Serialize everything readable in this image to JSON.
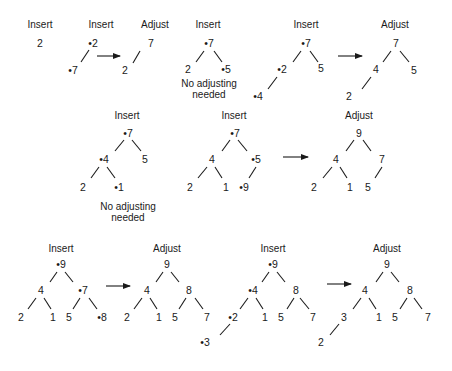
{
  "diagram": {
    "colors": {
      "ink": "#1a1a1a",
      "background": "#ffffff"
    },
    "labels": [
      {
        "text": "Insert",
        "x": 40,
        "y": 28
      },
      {
        "text": "Insert",
        "x": 101,
        "y": 28
      },
      {
        "text": "Adjust",
        "x": 155,
        "y": 28
      },
      {
        "text": "Insert",
        "x": 208,
        "y": 28
      },
      {
        "text": "Insert",
        "x": 306,
        "y": 28
      },
      {
        "text": "Adjust",
        "x": 395,
        "y": 28
      },
      {
        "text": "Insert",
        "x": 127,
        "y": 119
      },
      {
        "text": "Insert",
        "x": 234,
        "y": 119
      },
      {
        "text": "Adjust",
        "x": 359,
        "y": 119
      },
      {
        "text": "Insert",
        "x": 61,
        "y": 252
      },
      {
        "text": "Adjust",
        "x": 167,
        "y": 252
      },
      {
        "text": "Insert",
        "x": 273,
        "y": 252
      },
      {
        "text": "Adjust",
        "x": 387,
        "y": 252
      }
    ],
    "nodes": [
      {
        "text": "2",
        "x": 40,
        "y": 47
      },
      {
        "text": "•2",
        "x": 93,
        "y": 47
      },
      {
        "text": "•7",
        "x": 73,
        "y": 74
      },
      {
        "text": "7",
        "x": 151,
        "y": 47
      },
      {
        "text": "2",
        "x": 125,
        "y": 74
      },
      {
        "text": "•7",
        "x": 209,
        "y": 47
      },
      {
        "text": "2",
        "x": 188,
        "y": 73
      },
      {
        "text": "•5",
        "x": 226,
        "y": 73
      },
      {
        "text": "•7",
        "x": 306,
        "y": 47
      },
      {
        "text": "•2",
        "x": 282,
        "y": 73
      },
      {
        "text": "5",
        "x": 321,
        "y": 72
      },
      {
        "text": "•4",
        "x": 258,
        "y": 100
      },
      {
        "text": "7",
        "x": 396,
        "y": 47
      },
      {
        "text": "4",
        "x": 376,
        "y": 73
      },
      {
        "text": "5",
        "x": 414,
        "y": 74
      },
      {
        "text": "2",
        "x": 349,
        "y": 100
      },
      {
        "text": "•7",
        "x": 128,
        "y": 137
      },
      {
        "text": "•4",
        "x": 104,
        "y": 163
      },
      {
        "text": "5",
        "x": 145,
        "y": 163
      },
      {
        "text": "2",
        "x": 83,
        "y": 191
      },
      {
        "text": "•1",
        "x": 119,
        "y": 191
      },
      {
        "text": "•7",
        "x": 235,
        "y": 137
      },
      {
        "text": "4",
        "x": 212,
        "y": 163
      },
      {
        "text": "•5",
        "x": 256,
        "y": 163
      },
      {
        "text": "2",
        "x": 190,
        "y": 191
      },
      {
        "text": "1",
        "x": 226,
        "y": 191
      },
      {
        "text": "•9",
        "x": 244,
        "y": 191
      },
      {
        "text": "9",
        "x": 359,
        "y": 137
      },
      {
        "text": "4",
        "x": 336,
        "y": 163
      },
      {
        "text": "7",
        "x": 382,
        "y": 163
      },
      {
        "text": "2",
        "x": 314,
        "y": 191
      },
      {
        "text": "1",
        "x": 350,
        "y": 191
      },
      {
        "text": "5",
        "x": 368,
        "y": 191
      },
      {
        "text": "•9",
        "x": 61,
        "y": 268
      },
      {
        "text": "4",
        "x": 41,
        "y": 294
      },
      {
        "text": "•7",
        "x": 83,
        "y": 294
      },
      {
        "text": "2",
        "x": 21,
        "y": 321
      },
      {
        "text": "1",
        "x": 53,
        "y": 321
      },
      {
        "text": "5",
        "x": 69,
        "y": 321
      },
      {
        "text": "•8",
        "x": 102,
        "y": 321
      },
      {
        "text": "9",
        "x": 167,
        "y": 268
      },
      {
        "text": "4",
        "x": 147,
        "y": 294
      },
      {
        "text": "8",
        "x": 189,
        "y": 294
      },
      {
        "text": "2",
        "x": 127,
        "y": 321
      },
      {
        "text": "1",
        "x": 159,
        "y": 321
      },
      {
        "text": "5",
        "x": 175,
        "y": 321
      },
      {
        "text": "7",
        "x": 207,
        "y": 321
      },
      {
        "text": "•9",
        "x": 273,
        "y": 268
      },
      {
        "text": "•4",
        "x": 253,
        "y": 294
      },
      {
        "text": "8",
        "x": 296,
        "y": 294
      },
      {
        "text": "•2",
        "x": 233,
        "y": 321
      },
      {
        "text": "1",
        "x": 265,
        "y": 321
      },
      {
        "text": "5",
        "x": 281,
        "y": 321
      },
      {
        "text": "7",
        "x": 313,
        "y": 321
      },
      {
        "text": "•3",
        "x": 205,
        "y": 346
      },
      {
        "text": "9",
        "x": 387,
        "y": 268
      },
      {
        "text": "4",
        "x": 365,
        "y": 294
      },
      {
        "text": "8",
        "x": 410,
        "y": 294
      },
      {
        "text": "3",
        "x": 344,
        "y": 321
      },
      {
        "text": "1",
        "x": 379,
        "y": 321
      },
      {
        "text": "5",
        "x": 395,
        "y": 321
      },
      {
        "text": "7",
        "x": 428,
        "y": 321
      },
      {
        "text": "2",
        "x": 321,
        "y": 346
      }
    ],
    "notes": [
      {
        "lines": [
          "No adjusting",
          "needed"
        ],
        "x": 209,
        "y": 87
      },
      {
        "lines": [
          "No adjusting",
          "needed"
        ],
        "x": 128,
        "y": 210
      }
    ],
    "edges": [
      [
        89,
        50,
        81,
        62
      ],
      [
        140,
        51,
        133,
        63
      ],
      [
        204,
        51,
        196,
        62
      ],
      [
        214,
        51,
        222,
        62
      ],
      [
        301,
        51,
        293,
        62
      ],
      [
        310,
        51,
        318,
        62
      ],
      [
        277,
        77,
        268,
        89
      ],
      [
        391,
        51,
        383,
        62
      ],
      [
        400,
        51,
        409,
        62
      ],
      [
        371,
        77,
        362,
        89
      ],
      [
        124,
        140,
        115,
        151
      ],
      [
        132,
        140,
        141,
        151
      ],
      [
        99,
        167,
        91,
        178
      ],
      [
        107,
        167,
        115,
        178
      ],
      [
        230,
        140,
        222,
        151
      ],
      [
        238,
        140,
        247,
        151
      ],
      [
        207,
        167,
        198,
        178
      ],
      [
        215,
        167,
        222,
        178
      ],
      [
        256,
        167,
        249,
        178
      ],
      [
        354,
        140,
        346,
        151
      ],
      [
        363,
        140,
        371,
        151
      ],
      [
        332,
        167,
        323,
        178
      ],
      [
        340,
        167,
        347,
        178
      ],
      [
        382,
        167,
        375,
        178
      ],
      [
        57,
        272,
        50,
        282
      ],
      [
        65,
        272,
        73,
        282
      ],
      [
        36,
        298,
        28,
        309
      ],
      [
        44,
        298,
        51,
        309
      ],
      [
        80,
        298,
        73,
        309
      ],
      [
        89,
        298,
        97,
        309
      ],
      [
        163,
        272,
        156,
        282
      ],
      [
        171,
        272,
        179,
        282
      ],
      [
        142,
        298,
        134,
        309
      ],
      [
        150,
        298,
        157,
        309
      ],
      [
        186,
        298,
        179,
        309
      ],
      [
        195,
        298,
        203,
        309
      ],
      [
        269,
        272,
        262,
        282
      ],
      [
        277,
        272,
        285,
        282
      ],
      [
        248,
        298,
        240,
        309
      ],
      [
        256,
        298,
        263,
        309
      ],
      [
        294,
        298,
        287,
        309
      ],
      [
        300,
        298,
        309,
        309
      ],
      [
        230,
        324,
        220,
        335
      ],
      [
        383,
        272,
        376,
        282
      ],
      [
        391,
        272,
        399,
        282
      ],
      [
        361,
        298,
        353,
        309
      ],
      [
        369,
        298,
        376,
        309
      ],
      [
        407,
        298,
        400,
        309
      ],
      [
        414,
        298,
        422,
        309
      ],
      [
        339,
        324,
        330,
        335
      ]
    ],
    "arrows": [
      [
        97,
        56,
        120,
        56
      ],
      [
        338,
        56,
        362,
        56
      ],
      [
        283,
        157,
        308,
        157
      ],
      [
        106,
        286,
        130,
        286
      ],
      [
        327,
        284,
        351,
        284
      ]
    ]
  }
}
